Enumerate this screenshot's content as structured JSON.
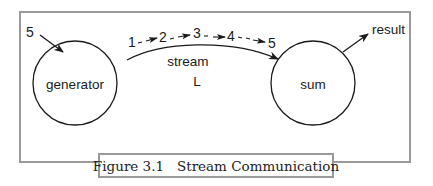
{
  "diagram": {
    "nodes": [
      {
        "id": "generator",
        "label": "generator",
        "shape": "circle"
      },
      {
        "id": "sum",
        "label": "sum",
        "shape": "circle"
      }
    ],
    "input": {
      "label": "5",
      "target": "generator"
    },
    "output": {
      "label": "result",
      "source": "sum"
    },
    "stream": {
      "label": "stream",
      "name": "L",
      "items": [
        "1",
        "2",
        "3",
        "4",
        "5"
      ]
    },
    "caption": "Figure 3.1   Stream Communication",
    "colors": {
      "frame": "#9a9a9a",
      "ink": "#1a1a1a"
    }
  }
}
